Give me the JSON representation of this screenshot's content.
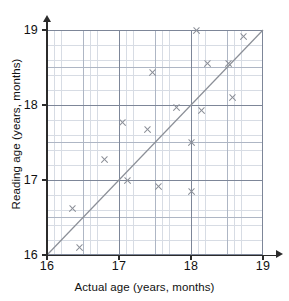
{
  "chart_data": {
    "type": "scatter",
    "title": "",
    "xlabel": "Actual age (years, months)",
    "ylabel": "Reading age (years, months)",
    "xlim": [
      16,
      19
    ],
    "ylim": [
      16,
      19
    ],
    "xticks": [
      "16",
      "17",
      "18",
      "19"
    ],
    "yticks": [
      "16",
      "17",
      "18",
      "19"
    ],
    "xtick_values": [
      16,
      17,
      18,
      19
    ],
    "ytick_values": [
      16,
      17,
      18,
      19
    ],
    "grid": true,
    "grid_minor": true,
    "legend": false,
    "marker": "x",
    "marker_color": "#8b8f97",
    "reference_line": {
      "label": "y = x",
      "from": [
        16,
        16
      ],
      "to": [
        19,
        19
      ],
      "color": "#8b8f97"
    },
    "points": [
      {
        "x": 16.35,
        "y": 16.62
      },
      {
        "x": 16.45,
        "y": 16.1
      },
      {
        "x": 16.8,
        "y": 17.27
      },
      {
        "x": 17.05,
        "y": 17.77
      },
      {
        "x": 17.12,
        "y": 17.0
      },
      {
        "x": 17.4,
        "y": 17.68
      },
      {
        "x": 17.47,
        "y": 18.44
      },
      {
        "x": 17.55,
        "y": 16.92
      },
      {
        "x": 17.8,
        "y": 17.97
      },
      {
        "x": 18.0,
        "y": 17.5
      },
      {
        "x": 18.0,
        "y": 16.85
      },
      {
        "x": 18.07,
        "y": 19.0
      },
      {
        "x": 18.14,
        "y": 17.93
      },
      {
        "x": 18.23,
        "y": 18.55
      },
      {
        "x": 18.52,
        "y": 18.55
      },
      {
        "x": 18.57,
        "y": 18.1
      },
      {
        "x": 18.73,
        "y": 18.92
      }
    ]
  },
  "axes": {
    "x_title": "Actual age (years, months)",
    "y_title": "Reading age (years, months)",
    "x_tick_labels": [
      "16",
      "17",
      "18",
      "19"
    ],
    "y_tick_labels": [
      "16",
      "17",
      "18",
      "19"
    ]
  },
  "colors": {
    "marker": "#8b8f97",
    "reference_line": "#8b8f97",
    "axis": "#2b2b2b",
    "grid_fine": "#d7dce4",
    "grid_medium": "#aeb6c4",
    "grid_major": "#7d8698",
    "text": "#111111",
    "background": "#ffffff"
  }
}
